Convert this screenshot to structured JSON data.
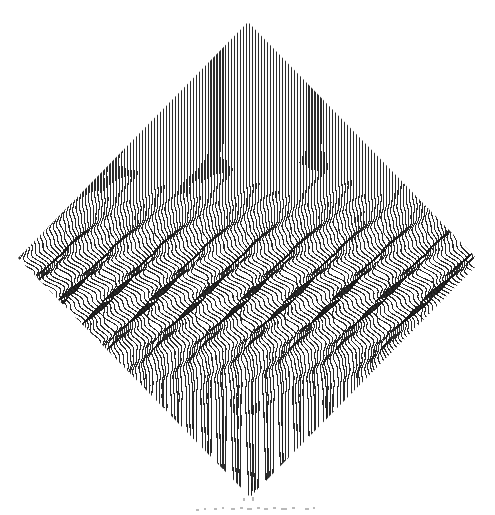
{
  "artwork": {
    "title": "Op-Art Moire Diamond",
    "medium": "line-drawing",
    "canvas": {
      "width": 495,
      "height": 515
    },
    "background_color": "#ffffff",
    "line_color": "#1a1a1a",
    "diamond": {
      "top": {
        "x": 248,
        "y": 22
      },
      "right": {
        "x": 480,
        "y": 262
      },
      "bottom": {
        "x": 250,
        "y": 497
      },
      "left": {
        "x": 18,
        "y": 258
      }
    },
    "line_field": {
      "orientation": "vertical",
      "count": 156,
      "spacing_px": 2.97,
      "stroke_width_px": 1.15,
      "stroke_opacity": 0.92
    },
    "distortion": {
      "description": "horizontal band of sinusoidal S-curve ripples through the middle",
      "band_center_y": 292,
      "band_half_height": 62,
      "wave_amplitude_px": 9.5,
      "wave_period_px": 46,
      "secondary_amplitude_px": 3.2,
      "secondary_period_px": 17,
      "lower_shear_px": 6.0
    },
    "artifacts": {
      "description": "faint scanner speckle below bottom vertex",
      "color": "#b9b9b9",
      "marks": [
        {
          "x": 214,
          "y": 508,
          "w": 3,
          "h": 2
        },
        {
          "x": 222,
          "y": 507,
          "w": 2,
          "h": 2
        },
        {
          "x": 231,
          "y": 508,
          "w": 4,
          "h": 2
        },
        {
          "x": 240,
          "y": 507,
          "w": 3,
          "h": 2
        },
        {
          "x": 247,
          "y": 508,
          "w": 5,
          "h": 2
        },
        {
          "x": 257,
          "y": 507,
          "w": 3,
          "h": 2
        },
        {
          "x": 264,
          "y": 508,
          "w": 4,
          "h": 2
        },
        {
          "x": 273,
          "y": 507,
          "w": 3,
          "h": 2
        },
        {
          "x": 281,
          "y": 508,
          "w": 6,
          "h": 2
        },
        {
          "x": 292,
          "y": 507,
          "w": 3,
          "h": 2
        },
        {
          "x": 305,
          "y": 508,
          "w": 4,
          "h": 2
        },
        {
          "x": 313,
          "y": 507,
          "w": 2,
          "h": 2
        },
        {
          "x": 196,
          "y": 509,
          "w": 3,
          "h": 2
        },
        {
          "x": 204,
          "y": 508,
          "w": 2,
          "h": 2
        },
        {
          "x": 243,
          "y": 498,
          "w": 2,
          "h": 3
        },
        {
          "x": 252,
          "y": 497,
          "w": 2,
          "h": 4
        }
      ]
    }
  }
}
